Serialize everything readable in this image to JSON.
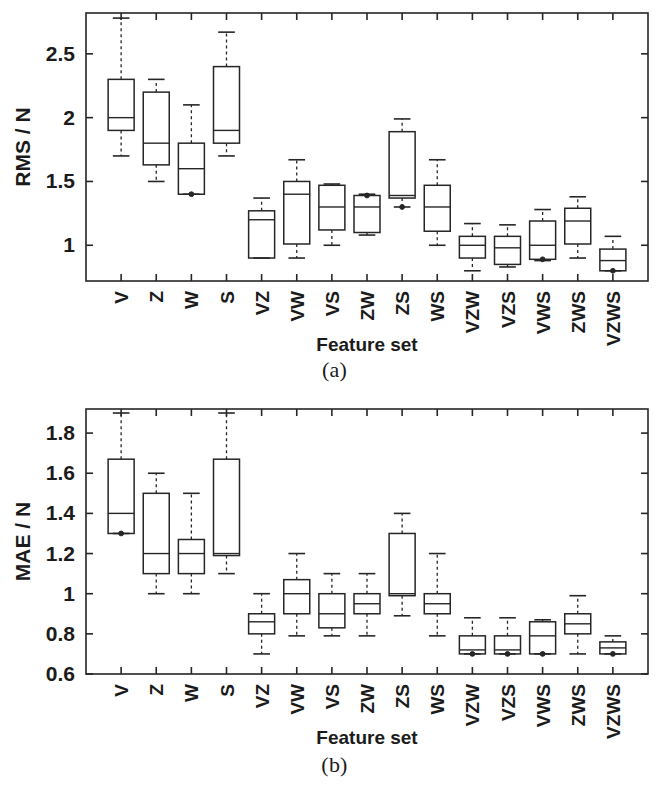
{
  "figure": {
    "background": "#ffffff",
    "line_color": "#262626",
    "width": 669,
    "height": 795
  },
  "panels": [
    {
      "id": "a",
      "caption": "(a)",
      "chart_data": {
        "type": "box",
        "title": "",
        "xlabel": "Feature set",
        "ylabel": "RMS / N",
        "categories": [
          "V",
          "Z",
          "W",
          "S",
          "VZ",
          "VW",
          "VS",
          "ZW",
          "ZS",
          "WS",
          "VZW",
          "VZS",
          "VWS",
          "ZWS",
          "VZWS"
        ],
        "ylim": [
          0.72,
          2.82
        ],
        "yticks": [
          1,
          1.5,
          2,
          2.5
        ],
        "ytick_labels": [
          "1",
          "1.5",
          "2",
          "2.5"
        ],
        "grid": false,
        "legend": "none",
        "boxes": [
          {
            "label": "V",
            "whisker_low": 1.7,
            "q1": 1.9,
            "median": 2.0,
            "q3": 2.3,
            "whisker_high": 2.78,
            "outliers": []
          },
          {
            "label": "Z",
            "whisker_low": 1.5,
            "q1": 1.63,
            "median": 1.8,
            "q3": 2.2,
            "whisker_high": 2.3,
            "outliers": []
          },
          {
            "label": "W",
            "whisker_low": 1.4,
            "q1": 1.4,
            "median": 1.6,
            "q3": 1.8,
            "whisker_high": 2.1,
            "outliers": [
              1.4
            ]
          },
          {
            "label": "S",
            "whisker_low": 1.7,
            "q1": 1.8,
            "median": 1.9,
            "q3": 2.4,
            "whisker_high": 2.67,
            "outliers": []
          },
          {
            "label": "VZ",
            "whisker_low": 0.9,
            "q1": 0.9,
            "median": 1.2,
            "q3": 1.27,
            "whisker_high": 1.37,
            "outliers": []
          },
          {
            "label": "VW",
            "whisker_low": 0.9,
            "q1": 1.01,
            "median": 1.4,
            "q3": 1.5,
            "whisker_high": 1.67,
            "outliers": []
          },
          {
            "label": "VS",
            "whisker_low": 1.0,
            "q1": 1.12,
            "median": 1.3,
            "q3": 1.47,
            "whisker_high": 1.48,
            "outliers": []
          },
          {
            "label": "ZW",
            "whisker_low": 1.08,
            "q1": 1.1,
            "median": 1.3,
            "q3": 1.39,
            "whisker_high": 1.4,
            "outliers": [
              1.39
            ]
          },
          {
            "label": "ZS",
            "whisker_low": 1.3,
            "q1": 1.37,
            "median": 1.39,
            "q3": 1.89,
            "whisker_high": 1.99,
            "outliers": [
              1.3
            ]
          },
          {
            "label": "WS",
            "whisker_low": 1.0,
            "q1": 1.11,
            "median": 1.3,
            "q3": 1.47,
            "whisker_high": 1.67,
            "outliers": []
          },
          {
            "label": "VZW",
            "whisker_low": 0.8,
            "q1": 0.9,
            "median": 1.0,
            "q3": 1.07,
            "whisker_high": 1.17,
            "outliers": []
          },
          {
            "label": "VZS",
            "whisker_low": 0.83,
            "q1": 0.85,
            "median": 0.98,
            "q3": 1.07,
            "whisker_high": 1.16,
            "outliers": []
          },
          {
            "label": "VWS",
            "whisker_low": 0.88,
            "q1": 0.89,
            "median": 1.0,
            "q3": 1.19,
            "whisker_high": 1.28,
            "outliers": [
              0.89
            ]
          },
          {
            "label": "ZWS",
            "whisker_low": 0.9,
            "q1": 1.01,
            "median": 1.19,
            "q3": 1.29,
            "whisker_high": 1.38,
            "outliers": []
          },
          {
            "label": "VZWS",
            "whisker_low": 0.8,
            "q1": 0.8,
            "median": 0.88,
            "q3": 0.97,
            "whisker_high": 1.07,
            "outliers": [
              0.8
            ]
          }
        ]
      }
    },
    {
      "id": "b",
      "caption": "(b)",
      "chart_data": {
        "type": "box",
        "title": "",
        "xlabel": "Feature set",
        "ylabel": "MAE / N",
        "categories": [
          "V",
          "Z",
          "W",
          "S",
          "VZ",
          "VW",
          "VS",
          "ZW",
          "ZS",
          "WS",
          "VZW",
          "VZS",
          "VWS",
          "ZWS",
          "VZWS"
        ],
        "ylim": [
          0.6,
          1.92
        ],
        "yticks": [
          0.6,
          0.8,
          1,
          1.2,
          1.4,
          1.6,
          1.8
        ],
        "ytick_labels": [
          "0.6",
          "0.8",
          "1",
          "1.2",
          "1.4",
          "1.6",
          "1.8"
        ],
        "grid": false,
        "legend": "none",
        "boxes": [
          {
            "label": "V",
            "whisker_low": 1.3,
            "q1": 1.3,
            "median": 1.4,
            "q3": 1.67,
            "whisker_high": 1.9,
            "outliers": [
              1.3
            ]
          },
          {
            "label": "Z",
            "whisker_low": 1.0,
            "q1": 1.1,
            "median": 1.2,
            "q3": 1.5,
            "whisker_high": 1.6,
            "outliers": []
          },
          {
            "label": "W",
            "whisker_low": 1.0,
            "q1": 1.1,
            "median": 1.2,
            "q3": 1.27,
            "whisker_high": 1.5,
            "outliers": []
          },
          {
            "label": "S",
            "whisker_low": 1.1,
            "q1": 1.19,
            "median": 1.2,
            "q3": 1.67,
            "whisker_high": 1.9,
            "outliers": []
          },
          {
            "label": "VZ",
            "whisker_low": 0.7,
            "q1": 0.8,
            "median": 0.86,
            "q3": 0.9,
            "whisker_high": 1.0,
            "outliers": []
          },
          {
            "label": "VW",
            "whisker_low": 0.79,
            "q1": 0.9,
            "median": 1.0,
            "q3": 1.07,
            "whisker_high": 1.2,
            "outliers": []
          },
          {
            "label": "VS",
            "whisker_low": 0.79,
            "q1": 0.83,
            "median": 0.9,
            "q3": 1.0,
            "whisker_high": 1.1,
            "outliers": []
          },
          {
            "label": "ZW",
            "whisker_low": 0.79,
            "q1": 0.9,
            "median": 0.95,
            "q3": 1.0,
            "whisker_high": 1.1,
            "outliers": []
          },
          {
            "label": "ZS",
            "whisker_low": 0.89,
            "q1": 0.99,
            "median": 1.0,
            "q3": 1.3,
            "whisker_high": 1.4,
            "outliers": []
          },
          {
            "label": "WS",
            "whisker_low": 0.79,
            "q1": 0.9,
            "median": 0.95,
            "q3": 1.0,
            "whisker_high": 1.2,
            "outliers": []
          },
          {
            "label": "VZW",
            "whisker_low": 0.7,
            "q1": 0.7,
            "median": 0.72,
            "q3": 0.79,
            "whisker_high": 0.88,
            "outliers": [
              0.7
            ]
          },
          {
            "label": "VZS",
            "whisker_low": 0.7,
            "q1": 0.7,
            "median": 0.72,
            "q3": 0.79,
            "whisker_high": 0.88,
            "outliers": [
              0.7
            ]
          },
          {
            "label": "VWS",
            "whisker_low": 0.7,
            "q1": 0.7,
            "median": 0.79,
            "q3": 0.86,
            "whisker_high": 0.87,
            "outliers": [
              0.7
            ]
          },
          {
            "label": "ZWS",
            "whisker_low": 0.7,
            "q1": 0.8,
            "median": 0.85,
            "q3": 0.9,
            "whisker_high": 0.99,
            "outliers": []
          },
          {
            "label": "VZWS",
            "whisker_low": 0.7,
            "q1": 0.7,
            "median": 0.73,
            "q3": 0.76,
            "whisker_high": 0.79,
            "outliers": [
              0.7
            ]
          }
        ]
      }
    }
  ]
}
